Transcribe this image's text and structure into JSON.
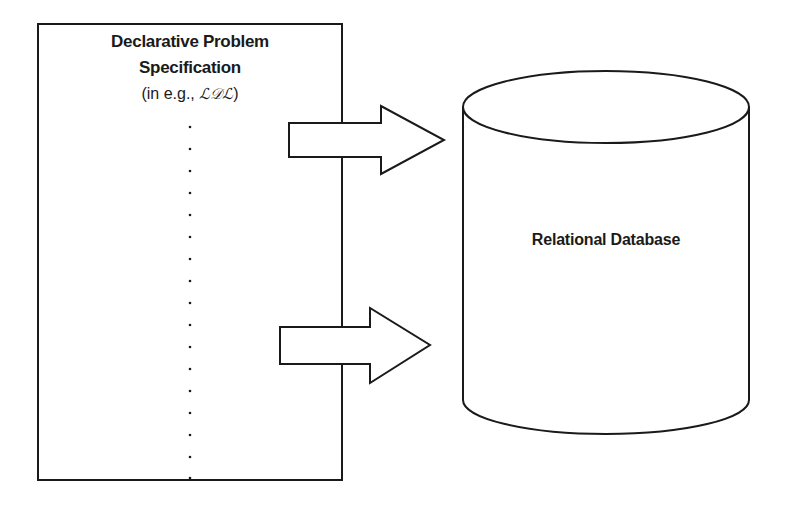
{
  "spec_box": {
    "title_line1": "Declarative Problem",
    "title_line2": "Specification",
    "subtitle_prefix": "(in e.g., ",
    "language": "ℒ𝒟ℒ",
    "subtitle_suffix": ")"
  },
  "database": {
    "label": "Relational Database"
  },
  "arrows": [
    {
      "direction": "right",
      "from": "spec_box",
      "to": "database"
    },
    {
      "direction": "right",
      "from": "spec_box",
      "to": "database"
    }
  ],
  "colors": {
    "stroke": "#1a1a1a",
    "fill": "#ffffff"
  }
}
